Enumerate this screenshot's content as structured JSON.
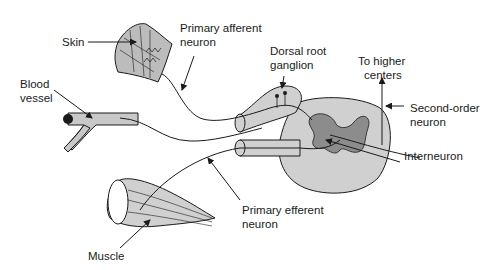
{
  "diagram": {
    "type": "reflex-arc-illustration",
    "colors": {
      "ink": "#1a1a1a",
      "tissue_fill": "#c8c8c8",
      "gray_matter": "#8c8c8c",
      "background": "#ffffff"
    },
    "labels": {
      "skin": "Skin",
      "primary_afferent_1": "Primary afferent",
      "primary_afferent_2": "neuron",
      "blood_vessel_1": "Blood",
      "blood_vessel_2": "vessel",
      "dorsal_root_1": "Dorsal root",
      "dorsal_root_2": "ganglion",
      "higher_centers_1": "To higher",
      "higher_centers_2": "centers",
      "second_order_1": "Second-order",
      "second_order_2": "neuron",
      "interneuron": "Interneuron",
      "primary_efferent_1": "Primary efferent",
      "primary_efferent_2": "neuron",
      "muscle": "Muscle"
    }
  }
}
